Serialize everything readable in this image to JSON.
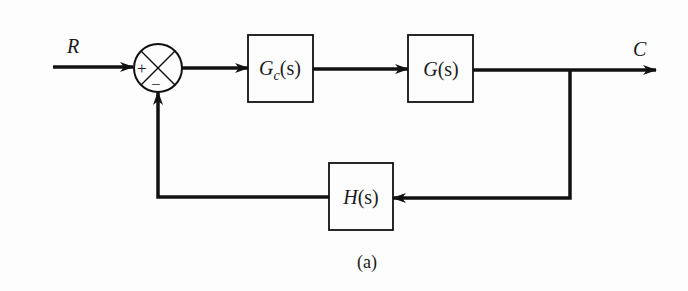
{
  "diagram": {
    "type": "feedback-control-block-diagram",
    "caption": "(a)",
    "signals": {
      "input": "R",
      "output": "C"
    },
    "summing_junction": {
      "plus_sign": "+",
      "minus_sign": "−"
    },
    "blocks": {
      "controller": {
        "name": "G",
        "sub": "c",
        "arg": "(s)"
      },
      "plant": {
        "name": "G",
        "arg": "(s)"
      },
      "feedback": {
        "name": "H",
        "arg": "(s)"
      }
    },
    "colors": {
      "line": "#111111",
      "background": "#fdfdfd"
    }
  }
}
